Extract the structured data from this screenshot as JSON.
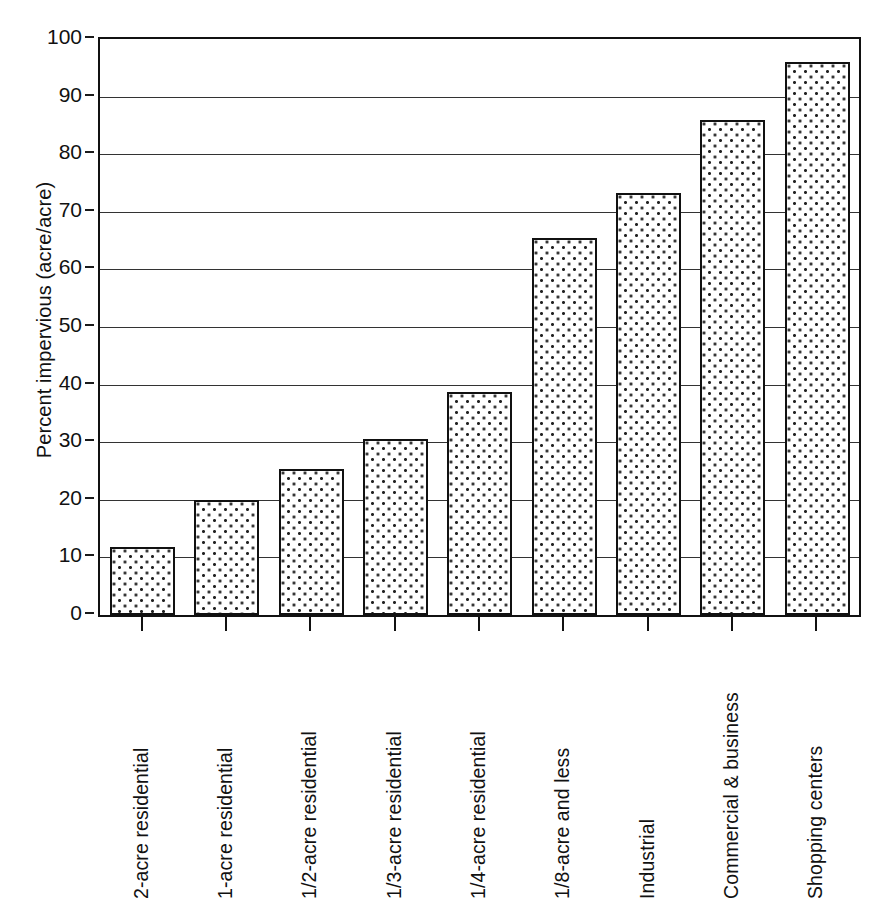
{
  "chart_data": {
    "type": "bar",
    "title": "",
    "xlabel": "",
    "ylabel": "Percent impervious (acre/acre)",
    "ylim": [
      0,
      100
    ],
    "ytick_values": [
      0,
      10,
      20,
      30,
      40,
      50,
      60,
      70,
      80,
      90,
      100
    ],
    "ytick_labels": [
      "0",
      "10",
      "20",
      "30",
      "40",
      "50",
      "60",
      "70",
      "80",
      "90",
      "100"
    ],
    "grid": "horizontal",
    "legend": "none",
    "categories": [
      "2-acre residential",
      "1-acre residential",
      "1/2-acre residential",
      "1/3-acre residential",
      "1/4-acre residential",
      "1/8-acre and less",
      "Industrial",
      "Commercial & business",
      "Shopping centers"
    ],
    "values": [
      11.8,
      20.0,
      25.3,
      30.5,
      38.7,
      65.5,
      73.2,
      86.0,
      96.0
    ],
    "bar_fill": "dotted-pattern",
    "bar_edge_color": "#111111",
    "bar_face_color": "#ffffff",
    "axis_color": "#111111",
    "background_color": "#ffffff"
  }
}
